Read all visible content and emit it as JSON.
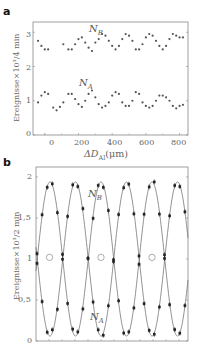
{
  "chart_data": [
    {
      "panel": "a",
      "type": "scatter",
      "xlabel": "ΔD_Al(μm)",
      "ylabel": "Ereignisse×10³/4 min",
      "xlim": [
        -70,
        850
      ],
      "ylim": [
        0,
        3.3
      ],
      "xticks": [
        0,
        200,
        400,
        600,
        800
      ],
      "yticks": [
        0,
        1,
        2,
        3
      ],
      "grid": false,
      "series": [
        {
          "name": "N_B",
          "x": [
            -40,
            -20,
            0,
            20,
            110,
            140,
            160,
            180,
            200,
            220,
            240,
            260,
            280,
            300,
            320,
            340,
            360,
            380,
            400,
            420,
            440,
            460,
            480,
            500,
            520,
            540,
            560,
            580,
            600,
            620,
            640,
            660,
            680,
            700,
            720,
            740,
            760,
            780,
            800,
            820
          ],
          "y": [
            2.75,
            2.6,
            2.5,
            2.5,
            2.65,
            2.5,
            2.5,
            2.65,
            2.8,
            2.85,
            2.7,
            2.55,
            2.45,
            2.7,
            2.8,
            2.95,
            2.9,
            2.75,
            2.6,
            2.5,
            2.6,
            2.8,
            2.95,
            2.9,
            2.75,
            2.5,
            2.5,
            2.65,
            2.85,
            2.95,
            2.9,
            2.75,
            2.6,
            2.5,
            2.6,
            2.8,
            2.95,
            2.9,
            2.85,
            2.85
          ]
        },
        {
          "name": "N_A",
          "x": [
            -40,
            -20,
            0,
            20,
            50,
            70,
            90,
            110,
            140,
            160,
            180,
            200,
            220,
            240,
            260,
            280,
            300,
            320,
            340,
            360,
            380,
            400,
            420,
            440,
            460,
            480,
            500,
            520,
            540,
            560,
            580,
            600,
            620,
            640,
            660,
            680,
            700,
            720,
            740,
            760,
            780,
            800,
            820
          ],
          "y": [
            0.95,
            1.15,
            1.25,
            1.2,
            0.8,
            0.72,
            0.82,
            0.95,
            1.2,
            1.2,
            1.05,
            0.9,
            0.82,
            1.0,
            1.2,
            1.3,
            1.1,
            0.9,
            0.8,
            0.85,
            0.95,
            1.15,
            1.25,
            1.2,
            0.95,
            0.85,
            0.85,
            1.0,
            1.25,
            1.2,
            0.95,
            0.85,
            0.8,
            0.85,
            1.0,
            1.15,
            1.15,
            1.1,
            1.0,
            0.85,
            0.78,
            0.85,
            0.88
          ]
        }
      ],
      "annotations": [
        "N_B",
        "N_A"
      ]
    },
    {
      "panel": "b",
      "type": "line",
      "xlabel": "",
      "ylabel": "Ereignisse×10³/2 min",
      "ylim": [
        0,
        2.05
      ],
      "yticks": [
        0,
        0.5,
        1,
        1.5,
        2
      ],
      "ytick_labels": [
        "0",
        "0,5",
        "1",
        "1,5",
        "2"
      ],
      "grid": false,
      "x_unit": "relative (0–1 across panel)",
      "series": [
        {
          "name": "N_B",
          "fit": "1 + 0.93*sin(2π(x-0.085)/0.335 + π/2 offset)",
          "x": [
            0.0,
            0.05,
            0.1,
            0.15,
            0.2,
            0.25,
            0.3,
            0.35,
            0.4,
            0.45,
            0.5,
            0.55,
            0.6,
            0.65,
            0.7,
            0.75,
            0.8,
            0.85,
            0.9,
            0.95,
            1.0
          ],
          "y": [
            1.58,
            1.28,
            1.03,
            1.0,
            1.32,
            1.65,
            1.92,
            1.98,
            1.85,
            1.55,
            1.22,
            0.95,
            1.1,
            1.5,
            1.8,
            1.88,
            1.72,
            1.4,
            1.05,
            0.95,
            1.25
          ]
        },
        {
          "name": "N_A",
          "x": [
            0.0,
            0.05,
            0.1,
            0.15,
            0.2,
            0.25,
            0.3,
            0.35,
            0.4,
            0.45,
            0.5,
            0.55,
            0.6,
            0.65,
            0.7,
            0.75,
            0.8,
            0.85,
            0.9,
            0.95,
            1.0
          ],
          "y": [
            0.48,
            0.78,
            1.0,
            1.05,
            0.7,
            0.38,
            0.15,
            0.05,
            0.2,
            0.48,
            0.8,
            1.08,
            1.0,
            0.55,
            0.25,
            0.1,
            0.28,
            0.6,
            0.98,
            1.02,
            0.3
          ]
        }
      ],
      "annotations": [
        "N_B",
        "N_A"
      ]
    }
  ],
  "labels": {
    "panel_a": "a",
    "panel_b": "b",
    "a_ylabel": "Ereignisse×10³/4 min",
    "a_xlabel": "ΔD",
    "a_xlabel_sub": "Al",
    "a_xlabel_unit": "(μm)",
    "b_ylabel": "Ereignisse×10³/2 min",
    "series_b": "N",
    "series_b_sub": "B",
    "series_a": "N",
    "series_a_sub": "A",
    "a_yticks": [
      "0",
      "1",
      "2",
      "3"
    ],
    "a_xticks": [
      "0",
      "200",
      "400",
      "600",
      "800"
    ],
    "b_yticks": [
      "0",
      "0,5",
      "1",
      "1,5",
      "2"
    ]
  },
  "colors": {
    "marker": "#555555",
    "line": "#777777",
    "frame": "#888888"
  }
}
